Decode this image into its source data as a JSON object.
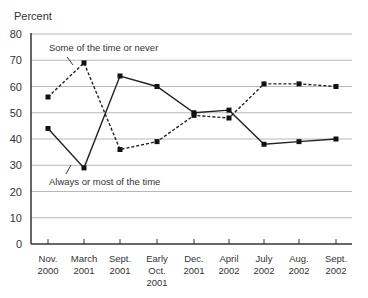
{
  "chart_data": {
    "type": "line",
    "title": "",
    "ylabel": "Percent",
    "xlabel": "",
    "ylim": [
      0,
      80
    ],
    "yticks": [
      0,
      10,
      20,
      30,
      40,
      50,
      60,
      70,
      80
    ],
    "grid": true,
    "categories": [
      [
        "Nov.",
        "2000"
      ],
      [
        "March",
        "2001"
      ],
      [
        "Sept.",
        "2001"
      ],
      [
        "Early",
        "Oct.",
        "2001"
      ],
      [
        "Dec.",
        "2001"
      ],
      [
        "April",
        "2002"
      ],
      [
        "July",
        "2002"
      ],
      [
        "Aug.",
        "2002"
      ],
      [
        "Sept.",
        "2002"
      ]
    ],
    "series": [
      {
        "name": "Some of the time or never",
        "style": "dashed",
        "values": [
          56,
          69,
          36,
          39,
          49,
          48,
          61,
          61,
          60
        ]
      },
      {
        "name": "Always or most of the time",
        "style": "solid",
        "values": [
          44,
          29,
          64,
          60,
          50,
          51,
          38,
          39,
          40
        ]
      }
    ],
    "annotations": [
      {
        "text": "Some of the time or never",
        "series": 0
      },
      {
        "text": "Always or most of the time",
        "series": 1
      }
    ]
  }
}
